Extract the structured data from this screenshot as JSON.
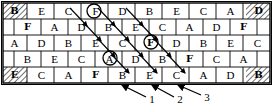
{
  "figure": {
    "grid": {
      "columns": 10,
      "rows": 5,
      "cell_width": 27,
      "row_height": 16,
      "origin_x": 3,
      "origin_y": 3,
      "offset_rows": [
        2,
        4
      ],
      "offset_px": 13
    },
    "colors": {
      "line": "#000000",
      "text": "#000000",
      "hatch": "#555555",
      "background": "#ffffff"
    },
    "rows": [
      {
        "index": 1,
        "offset": false,
        "cells": [
          {
            "label": "B",
            "style": "hatched"
          },
          {
            "label": "",
            "style": "plain"
          },
          {
            "label": "E",
            "style": "plain"
          },
          {
            "label": "",
            "style": "plain"
          },
          {
            "label": "C",
            "style": "plain"
          },
          {
            "label": "",
            "style": "plain"
          },
          {
            "label": "F",
            "style": "circled"
          },
          {
            "label": "",
            "style": "plain"
          },
          {
            "label": "D",
            "style": "plain"
          },
          {
            "label": "",
            "style": "plain"
          },
          {
            "label": "B",
            "style": "plain"
          },
          {
            "label": "",
            "style": "plain"
          },
          {
            "label": "E",
            "style": "plain"
          },
          {
            "label": "",
            "style": "plain"
          },
          {
            "label": "C",
            "style": "plain"
          },
          {
            "label": "",
            "style": "plain"
          },
          {
            "label": "A",
            "style": "plain"
          },
          {
            "label": "",
            "style": "plain"
          },
          {
            "label": "D",
            "style": "hatched"
          }
        ]
      },
      {
        "index": 2,
        "offset": true,
        "cells": [
          {
            "label": "F",
            "style": "plain"
          },
          {
            "label": "",
            "style": "plain"
          },
          {
            "label": "A",
            "style": "plain"
          },
          {
            "label": "",
            "style": "plain"
          },
          {
            "label": "D",
            "style": "plain"
          },
          {
            "label": "",
            "style": "plain"
          },
          {
            "label": "B",
            "style": "plain"
          },
          {
            "label": "",
            "style": "plain"
          },
          {
            "label": "E",
            "style": "plain"
          },
          {
            "label": "",
            "style": "plain"
          },
          {
            "label": "C",
            "style": "plain"
          },
          {
            "label": "",
            "style": "plain"
          },
          {
            "label": "A",
            "style": "plain"
          },
          {
            "label": "",
            "style": "plain"
          },
          {
            "label": "D",
            "style": "plain"
          },
          {
            "label": "",
            "style": "plain"
          },
          {
            "label": "F",
            "style": "plain"
          }
        ]
      },
      {
        "index": 3,
        "offset": false,
        "cells": [
          {
            "label": "A",
            "style": "plain"
          },
          {
            "label": "",
            "style": "plain"
          },
          {
            "label": "D",
            "style": "plain"
          },
          {
            "label": "",
            "style": "plain"
          },
          {
            "label": "B",
            "style": "plain"
          },
          {
            "label": "",
            "style": "plain"
          },
          {
            "label": "E",
            "style": "plain"
          },
          {
            "label": "",
            "style": "plain"
          },
          {
            "label": "C",
            "style": "plain"
          },
          {
            "label": "",
            "style": "plain"
          },
          {
            "label": "F",
            "style": "circled"
          },
          {
            "label": "",
            "style": "plain"
          },
          {
            "label": "D",
            "style": "plain"
          },
          {
            "label": "",
            "style": "plain"
          },
          {
            "label": "B",
            "style": "plain"
          },
          {
            "label": "",
            "style": "plain"
          },
          {
            "label": "E",
            "style": "plain"
          },
          {
            "label": "",
            "style": "plain"
          },
          {
            "label": "C",
            "style": "plain"
          }
        ]
      },
      {
        "index": 4,
        "offset": true,
        "cells": [
          {
            "label": "B",
            "style": "plain"
          },
          {
            "label": "",
            "style": "plain"
          },
          {
            "label": "E",
            "style": "plain"
          },
          {
            "label": "",
            "style": "plain"
          },
          {
            "label": "C",
            "style": "plain"
          },
          {
            "label": "",
            "style": "plain"
          },
          {
            "label": "A",
            "style": "circled"
          },
          {
            "label": "",
            "style": "plain"
          },
          {
            "label": "D",
            "style": "plain"
          },
          {
            "label": "",
            "style": "plain"
          },
          {
            "label": "B",
            "style": "plain"
          },
          {
            "label": "",
            "style": "plain"
          },
          {
            "label": "F",
            "style": "plain"
          },
          {
            "label": "",
            "style": "plain"
          },
          {
            "label": "C",
            "style": "plain"
          },
          {
            "label": "",
            "style": "plain"
          },
          {
            "label": "A",
            "style": "plain"
          }
        ]
      },
      {
        "index": 5,
        "offset": false,
        "cells": [
          {
            "label": "E",
            "style": "hatched"
          },
          {
            "label": "",
            "style": "plain"
          },
          {
            "label": "C",
            "style": "plain"
          },
          {
            "label": "",
            "style": "plain"
          },
          {
            "label": "A",
            "style": "plain"
          },
          {
            "label": "",
            "style": "plain"
          },
          {
            "label": "F",
            "style": "plain"
          },
          {
            "label": "",
            "style": "plain"
          },
          {
            "label": "B",
            "style": "plain"
          },
          {
            "label": "",
            "style": "plain"
          },
          {
            "label": "E",
            "style": "plain"
          },
          {
            "label": "",
            "style": "plain"
          },
          {
            "label": "C",
            "style": "plain"
          },
          {
            "label": "",
            "style": "plain"
          },
          {
            "label": "A",
            "style": "plain"
          },
          {
            "label": "",
            "style": "plain"
          },
          {
            "label": "D",
            "style": "plain"
          },
          {
            "label": "",
            "style": "plain"
          },
          {
            "label": "B",
            "style": "hatched"
          }
        ]
      }
    ],
    "circled_cells": [
      {
        "label": "F",
        "row": 1,
        "x": 94,
        "y": 11
      },
      {
        "label": "F",
        "row": 3,
        "x": 151,
        "y": 42
      },
      {
        "label": "A",
        "row": 4,
        "x": 110,
        "y": 58
      }
    ],
    "callouts": [
      {
        "label": "1",
        "label_x": 152,
        "label_y": 99,
        "tip_x": 122,
        "tip_y": 84
      },
      {
        "label": "2",
        "label_x": 180,
        "label_y": 99,
        "tip_x": 152,
        "tip_y": 84
      },
      {
        "label": "3",
        "label_x": 207,
        "label_y": 97,
        "tip_x": 178,
        "tip_y": 84
      }
    ],
    "diagonal_arrows": [
      {
        "x1": 70,
        "y1": 8,
        "x2": 88,
        "y2": 27
      },
      {
        "x1": 98,
        "y1": 8,
        "x2": 116,
        "y2": 27
      },
      {
        "x1": 126,
        "y1": 8,
        "x2": 144,
        "y2": 27
      },
      {
        "x1": 84,
        "y1": 22,
        "x2": 102,
        "y2": 41
      },
      {
        "x1": 112,
        "y1": 22,
        "x2": 130,
        "y2": 41
      },
      {
        "x1": 140,
        "y1": 22,
        "x2": 158,
        "y2": 41
      },
      {
        "x1": 98,
        "y1": 38,
        "x2": 116,
        "y2": 57
      },
      {
        "x1": 126,
        "y1": 38,
        "x2": 144,
        "y2": 57
      },
      {
        "x1": 154,
        "y1": 38,
        "x2": 172,
        "y2": 57
      },
      {
        "x1": 112,
        "y1": 54,
        "x2": 130,
        "y2": 73
      },
      {
        "x1": 140,
        "y1": 54,
        "x2": 158,
        "y2": 73
      },
      {
        "x1": 168,
        "y1": 54,
        "x2": 186,
        "y2": 73
      },
      {
        "x1": 155,
        "y1": 46,
        "x2": 140,
        "y2": 62
      }
    ]
  }
}
